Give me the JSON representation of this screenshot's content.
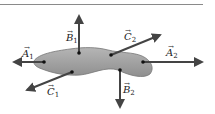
{
  "diagram": {
    "body_color": "#9a9a9a",
    "arrow_color": "#444444",
    "vectors": [
      {
        "name": "A",
        "subscript": "1",
        "label": "A1",
        "direction": "left"
      },
      {
        "name": "A",
        "subscript": "2",
        "label": "A2",
        "direction": "right"
      },
      {
        "name": "B",
        "subscript": "1",
        "label": "B1",
        "direction": "up"
      },
      {
        "name": "B",
        "subscript": "2",
        "label": "B2",
        "direction": "down"
      },
      {
        "name": "C",
        "subscript": "1",
        "label": "C1",
        "direction": "down-left"
      },
      {
        "name": "C",
        "subscript": "2",
        "label": "C2",
        "direction": "up-right"
      }
    ]
  }
}
